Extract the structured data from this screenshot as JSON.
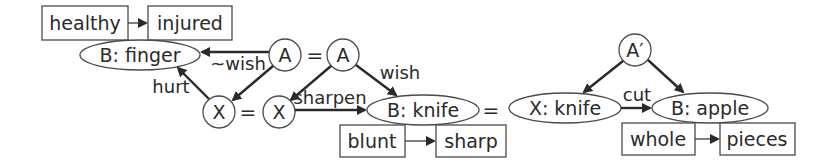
{
  "diagram": {
    "type": "causal-analogy-graph",
    "state_boxes": {
      "healthy": "healthy",
      "injured": "injured",
      "blunt": "blunt",
      "sharp": "sharp",
      "whole": "whole",
      "pieces": "pieces"
    },
    "nodes": {
      "b_finger": "B: finger",
      "a1": "A",
      "a2": "A",
      "x1": "X",
      "x2": "X",
      "b_knife": "B: knife",
      "x_knife": "X: knife",
      "a_prime": "A′",
      "b_apple": "B: apple"
    },
    "edge_labels": {
      "not_wish": "~wish",
      "hurt": "hurt",
      "wish": "wish",
      "sharpen": "sharpen",
      "cut": "cut"
    },
    "equals": "=",
    "colors": {
      "stroke": "#4a4a4a",
      "text": "#2a2a2a",
      "background": "#ffffff"
    }
  }
}
